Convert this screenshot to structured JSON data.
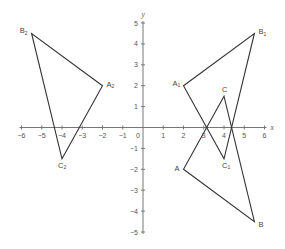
{
  "diagram": {
    "type": "coordinate-plane-transformations",
    "axes": {
      "x_label": "x",
      "y_label": "y",
      "x_range": [
        -6,
        6
      ],
      "y_range": [
        -5,
        5
      ],
      "x_ticks": [
        -6,
        -5,
        -4,
        -3,
        -2,
        -1,
        1,
        2,
        3,
        4,
        5,
        6
      ],
      "y_ticks": [
        -5,
        -4,
        -3,
        -2,
        -1,
        1,
        2,
        3,
        4,
        5
      ],
      "origin_label": "0",
      "x_tick_labels": [
        "−6",
        "−5",
        "−4",
        "−3",
        "−2",
        "−1",
        "1",
        "2",
        "3",
        "4",
        "5",
        "6"
      ],
      "y_tick_labels": [
        "−5",
        "−4",
        "−3",
        "−2",
        "−1",
        "1",
        "2",
        "3",
        "4",
        "5"
      ]
    },
    "colors": {
      "axis": "#777777",
      "shape_stroke": "#333333",
      "text": "#555555"
    },
    "triangles": [
      {
        "name": "ABC",
        "vertices": [
          {
            "label": "A",
            "sub": "",
            "x": 2,
            "y": -2
          },
          {
            "label": "B",
            "sub": "",
            "x": 5.5,
            "y": -4.5
          },
          {
            "label": "C",
            "sub": "",
            "x": 4,
            "y": 1.5
          }
        ]
      },
      {
        "name": "A1B1C1",
        "vertices": [
          {
            "label": "A",
            "sub": "1",
            "x": 2,
            "y": 2
          },
          {
            "label": "B",
            "sub": "1",
            "x": 5.5,
            "y": 4.5
          },
          {
            "label": "C",
            "sub": "1",
            "x": 4,
            "y": -1.5
          }
        ]
      },
      {
        "name": "A2B2C2",
        "vertices": [
          {
            "label": "A",
            "sub": "2",
            "x": -2,
            "y": 2
          },
          {
            "label": "B",
            "sub": "2",
            "x": -5.5,
            "y": 4.5
          },
          {
            "label": "C",
            "sub": "2",
            "x": -4,
            "y": -1.5
          }
        ]
      }
    ]
  },
  "labels": {
    "A": "A",
    "B": "B",
    "C": "C",
    "A1": "A",
    "B1": "B",
    "C1": "C",
    "A2": "A",
    "B2": "B",
    "C2": "C",
    "sub1": "1",
    "sub2": "2",
    "x": "x",
    "y": "y",
    "origin": "0"
  }
}
